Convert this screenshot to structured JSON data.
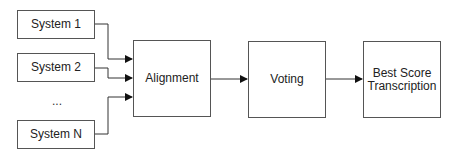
{
  "diagram": {
    "inputs": [
      {
        "label": "System 1"
      },
      {
        "label": "System 2"
      },
      {
        "label": "System N"
      }
    ],
    "ellipsis": "...",
    "stages": [
      {
        "label": "Alignment"
      },
      {
        "label": "Voting"
      },
      {
        "label_line1": "Best Score",
        "label_line2": "Transcription"
      }
    ],
    "colors": {
      "stroke": "#555555",
      "arrow": "#111111",
      "background": "#ffffff"
    }
  }
}
